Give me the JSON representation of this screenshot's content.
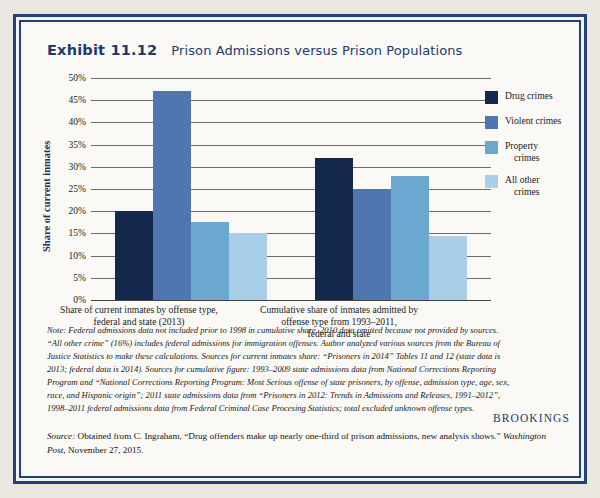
{
  "exhibit": {
    "number": "Exhibit 11.12",
    "title": "Prison Admissions versus Prison Populations"
  },
  "colors": {
    "frame": "#23407a",
    "title": "#1d3a6e",
    "drug": "#15294e",
    "violent": "#4f76ae",
    "property": "#6ba8d0",
    "other": "#a9cfe8",
    "gridline": "#6b6b6b"
  },
  "chart_data": {
    "type": "bar",
    "title": "Prison Admissions versus Prison Populations",
    "xlabel": "",
    "ylabel": "Share of current inmates",
    "ylim": [
      0,
      50
    ],
    "ytick_labels": [
      "0%",
      "5%",
      "10%",
      "15%",
      "20%",
      "25%",
      "30%",
      "35%",
      "40%",
      "45%",
      "50%"
    ],
    "ytick_values": [
      0,
      5,
      10,
      15,
      20,
      25,
      30,
      35,
      40,
      45,
      50
    ],
    "grid": true,
    "legend_position": "right",
    "categories": [
      "Share of current inmates by offense type, federal and state (2013)",
      "Cumulative share of inmates admitted by offense type from 1993–2011, federal and state"
    ],
    "category_lines": [
      [
        "Share of current inmates by offense type,",
        "federal and state (2013)"
      ],
      [
        "Cumulative share of inmates admitted by",
        "offense type from 1993–2011,",
        "federal and state"
      ]
    ],
    "series": [
      {
        "name": "Drug crimes",
        "color": "#15294e",
        "values": [
          20.0,
          32.0
        ]
      },
      {
        "name": "Violent crimes",
        "color": "#4f76ae",
        "values": [
          47.0,
          25.0
        ]
      },
      {
        "name": "Property crimes",
        "color": "#6ba8d0",
        "values": [
          17.5,
          28.0
        ]
      },
      {
        "name": "All other crimes",
        "color": "#a9cfe8",
        "values": [
          15.0,
          14.5
        ]
      }
    ]
  },
  "legend": {
    "items": [
      {
        "label": "Drug crimes",
        "line1": "Drug crimes",
        "line2": ""
      },
      {
        "label": "Violent crimes",
        "line1": "Violent crimes",
        "line2": ""
      },
      {
        "label": "Property crimes",
        "line1": "Property",
        "line2": "crimes"
      },
      {
        "label": "All other crimes",
        "line1": "All other",
        "line2": "crimes"
      }
    ]
  },
  "notes": {
    "label": "Note:",
    "body": " Federal admissions data not included prior to 1998 in cumulative share. 2010 data omitted because not provided by sources. “All other crime” (16%) includes federal admissions for immigration offenses. Author analyzed various sources from the Bureau of Justice Statistics to make these calculations. Sources for current inmates share: “Prisoners in 2014” Tables 11 and 12 (state data is 2013; federal data is 2014). Sources for cumulative figure: 1993–2009 state admissions data from National Corrections Reporting Program and “National Corrections Reporting Program: Most Serious offense of state prisoners, by offense, admission type, age, sex, race, and Hispanic origin”; 2011 state admissions data from “Prisoners in 2012: Trends in Admissions and Releases, 1991–2012”, 1998–2011 federal admissions data from Federal Criminal Case Procesing Statistics; total excluded unknown offense types."
  },
  "brand": {
    "name": "BROOKINGS"
  },
  "source": {
    "label": "Source:",
    "body": " Obtained from C. Ingraham, “Drug offenders make up nearly one-third of prison admissions, new analysis shows.” ",
    "publication": "Washington Post",
    "date": ", November 27, 2015."
  }
}
